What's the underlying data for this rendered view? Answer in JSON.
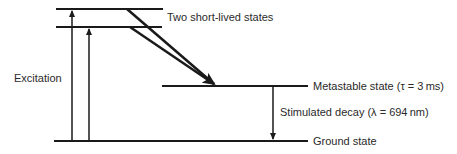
{
  "diagram": {
    "levels": {
      "upper_label": "Two short-lived states",
      "metastable_label": "Metastable state (τ = 3 ms)",
      "ground_label": "Ground state"
    },
    "transitions": {
      "excitation_label": "Excitation",
      "decay_label": "Stimulated decay (λ = 694 nm)"
    },
    "colors": {
      "line": "#1a1a1a",
      "text": "#2a2a2a"
    }
  }
}
